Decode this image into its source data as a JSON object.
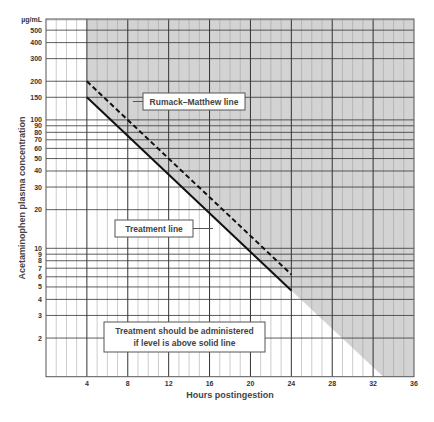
{
  "chart_data": {
    "type": "line",
    "title": "",
    "xlabel": "Hours postingestion",
    "ylabel": "Acetaminophen plasma concentration",
    "y_unit_label": "µg/mL",
    "y_scale": "log",
    "xlim": [
      0,
      36
    ],
    "ylim": [
      1,
      611
    ],
    "grid": true,
    "x_ticks": [
      4,
      8,
      12,
      16,
      20,
      24,
      28,
      32,
      36
    ],
    "y_ticks": [
      2,
      3,
      4,
      5,
      6,
      7,
      8,
      9,
      10,
      20,
      30,
      40,
      50,
      60,
      70,
      80,
      90,
      100,
      150,
      200,
      300,
      400,
      500
    ],
    "series": [
      {
        "name": "Rumack–Matthew line",
        "style": "dashed",
        "x": [
          4,
          24
        ],
        "y": [
          200,
          6.25
        ]
      },
      {
        "name": "Treatment line",
        "style": "solid",
        "x": [
          4,
          24
        ],
        "y": [
          150,
          4.7
        ]
      }
    ],
    "shaded_region": {
      "description": "Toxic zone above the treatment line (gray shading)",
      "boundary_x": [
        4,
        24,
        33
      ],
      "boundary_y": [
        150,
        4.7,
        1
      ],
      "color": "#d3d3d3"
    },
    "annotations": [
      {
        "id": "rumack",
        "text": "Rumack–Matthew line"
      },
      {
        "id": "treatment",
        "text": "Treatment line"
      },
      {
        "id": "note",
        "lines": [
          "Treatment should be administered",
          "if level is above solid line"
        ]
      }
    ],
    "legend": "none"
  },
  "labels": {
    "unit": "µg/mL",
    "xlabel": "Hours postingestion",
    "ylabel": "Acetaminophen plasma concentration",
    "rumack": "Rumack–Matthew line",
    "treatment": "Treatment line",
    "note_line1": "Treatment should be administered",
    "note_line2": "if level is above solid line"
  },
  "colors": {
    "shade": "#d3d3d3",
    "major_grid": "#333333",
    "minor_grid": "#999999",
    "line": "#111111"
  }
}
